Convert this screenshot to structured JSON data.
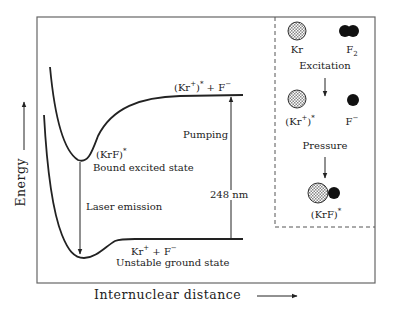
{
  "diagram": {
    "type": "potential-energy-curve",
    "title": "",
    "axes": {
      "y_label": "Energy",
      "x_label": "Internuclear distance"
    },
    "curves": [
      {
        "name": "bound-excited-state-curve",
        "state": "(KrF)*",
        "label": "Bound excited state",
        "asymptote_label_base": "(Kr",
        "asymptote_label_sup1": "+",
        "asymptote_label_mid": ")",
        "asymptote_label_sup2": "*",
        "asymptote_label_tail": " + F",
        "asymptote_label_sup3": "−"
      },
      {
        "name": "unstable-ground-state-curve",
        "label": "Unstable ground state",
        "asymptote_base": "Kr",
        "asymptote_sup1": "+",
        "asymptote_mid": " + F",
        "asymptote_sup2": "−"
      }
    ],
    "labels": {
      "krf_excited": "(KrF)",
      "krf_star": "*",
      "bound_excited_state": "Bound excited state",
      "laser_emission": "Laser emission",
      "pumping": "Pumping",
      "wavelength": "248 nm",
      "unstable_ground_state": "Unstable ground state"
    },
    "process_panel": {
      "step1": {
        "species_a": "Kr",
        "species_b_base": "F",
        "species_b_sub": "2"
      },
      "transition1": "Excitation",
      "step2": {
        "species_a_base": "(Kr",
        "species_a_sup": "+",
        "species_a_close": ")",
        "species_a_star": "*",
        "species_b_base": "F",
        "species_b_sup": "−"
      },
      "transition2": "Pressure",
      "step3": {
        "product_base": "(KrF)",
        "product_star": "*"
      }
    },
    "colors": {
      "line": "#222222",
      "frame": "#555555",
      "stipple_fill": "#bdbdbd",
      "solid_atom": "#111111"
    }
  }
}
